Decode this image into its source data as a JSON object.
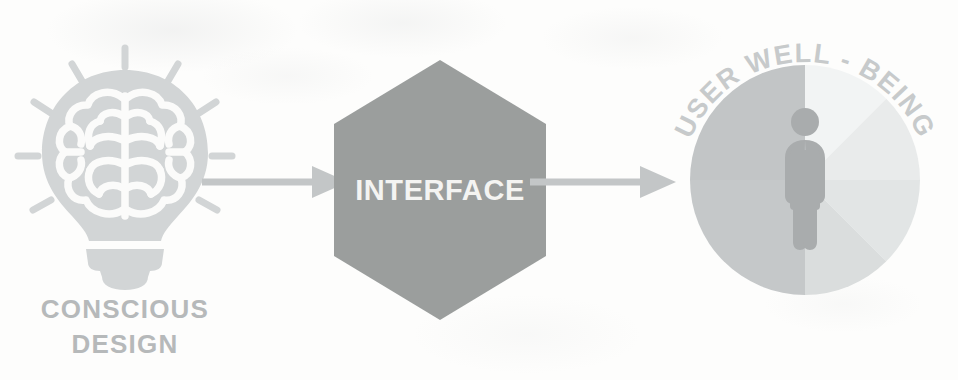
{
  "diagram": {
    "background_color": "#fdfdfc",
    "nodes": {
      "source": {
        "label_line1": "CONSCIOUS",
        "label_line2": "DESIGN",
        "icon": "lightbulb-brain-icon",
        "icon_color": "#d2d5d6",
        "label_color": "#b6b9ba"
      },
      "middle": {
        "label": "INTERFACE",
        "shape": "hexagon",
        "fill_color": "#9b9e9d",
        "text_color": "#f4f4f2"
      },
      "target": {
        "label": "USER WELL - BEING",
        "shape": "segmented-circle",
        "label_color": "#c9cccd",
        "pictogram": "person-icon",
        "pictogram_color": "#a9acad",
        "segments": [
          {
            "name": "upper-left",
            "start_deg": 270,
            "end_deg": 315,
            "color": "#c2c5c6"
          },
          {
            "name": "left-upper",
            "start_deg": 225,
            "end_deg": 270,
            "color": "#c2c5c6"
          },
          {
            "name": "left-lower",
            "start_deg": 180,
            "end_deg": 225,
            "color": "#c6c9ca"
          },
          {
            "name": "lower-left",
            "start_deg": 135,
            "end_deg": 180,
            "color": "#c6c9ca"
          },
          {
            "name": "lower-right-inner",
            "start_deg": 90,
            "end_deg": 135,
            "color": "#dadddd"
          },
          {
            "name": "lower-right-outer",
            "start_deg": 45,
            "end_deg": 90,
            "color": "#e2e5e5"
          },
          {
            "name": "right-lower",
            "start_deg": 0,
            "end_deg": 45,
            "color": "#e6e9e9"
          },
          {
            "name": "upper-right",
            "start_deg": 315,
            "end_deg": 360,
            "color": "#f1f3f3"
          }
        ]
      }
    },
    "connectors": [
      {
        "name": "arrow-one",
        "from": "source",
        "to": "middle",
        "color": "#c3c6c7"
      },
      {
        "name": "arrow-two",
        "from": "middle",
        "to": "target",
        "color": "#c3c6c7"
      }
    ]
  }
}
